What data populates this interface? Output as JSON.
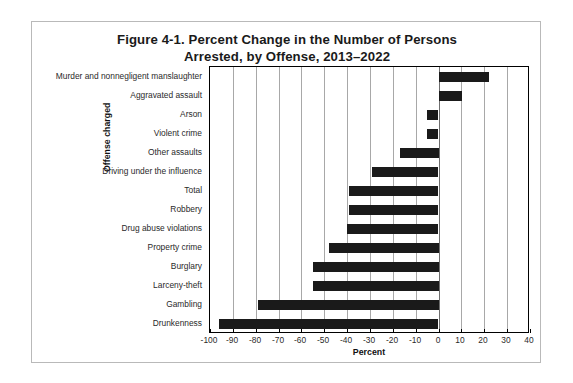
{
  "figure": {
    "title_line1": "Figure 4-1. Percent Change in the Number of Persons",
    "title_line2": "Arrested, by Offense, 2013–2022"
  },
  "chart_data": {
    "type": "bar",
    "orientation": "horizontal",
    "title": "Figure 4-1. Percent Change in the Number of Persons Arrested, by Offense, 2013–2022",
    "xlabel": "Percent",
    "ylabel": "Offense charged",
    "xlim": [
      -100,
      40
    ],
    "xticks": [
      -100,
      -90,
      -80,
      -70,
      -60,
      -50,
      -40,
      -30,
      -20,
      -10,
      0,
      10,
      20,
      30,
      40
    ],
    "xtick_labels": [
      "-100",
      "-90",
      "-80",
      "-70",
      "-60",
      "-50",
      "-40",
      "-30",
      "-20",
      "-10",
      "0",
      "10",
      "20",
      "30",
      "40"
    ],
    "grid": true,
    "legend": null,
    "bar_color": "#1a1a1a",
    "categories": [
      "Murder and nonnegligent manslaughter",
      "Aggravated assault",
      "Arson",
      "Violent crime",
      "Other assaults",
      "Driving under the influence",
      "Total",
      "Robbery",
      "Drug abuse violations",
      "Property crime",
      "Burglary",
      "Larceny-theft",
      "Gambling",
      "Drunkenness"
    ],
    "values": [
      22,
      10,
      -5,
      -5,
      -17,
      -29,
      -39,
      -39,
      -40,
      -48,
      -55,
      -55,
      -79,
      -96
    ]
  }
}
